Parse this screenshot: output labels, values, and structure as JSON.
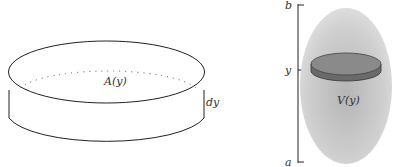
{
  "left_figure": {
    "area_label": "A(y)",
    "thickness_label": "dy"
  },
  "right_figure": {
    "axis_top_label": "b",
    "axis_mid_label": "y",
    "axis_bottom_label": "a",
    "volume_label": "V(y)"
  },
  "colors": {
    "stroke": "#222222",
    "solid_fill": "#c8c8c8",
    "slice_top": "#8a8a8a",
    "slice_side": "#6a6a6a"
  }
}
